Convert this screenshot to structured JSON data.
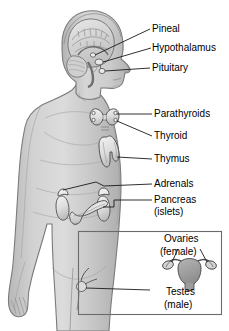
{
  "figure": {
    "background_color": "#ffffff",
    "body_fill": "#c9c9c9",
    "body_outline": "#6e6e6e",
    "organ_fill": "#e4e4e4",
    "organ_outline": "#555555",
    "leader_color": "#1a1a1a",
    "inset_border": "#6b6b6b",
    "label_color": "#000000"
  },
  "labels": {
    "pineal": "Pineal",
    "hypothalamus": "Hypothalamus",
    "pituitary": "Pituitary",
    "parathyroids": "Parathyroids",
    "thyroid": "Thyroid",
    "thymus": "Thymus",
    "adrenals": "Adrenals",
    "pancreas": "Pancreas",
    "pancreas_sub": "(islets)",
    "ovaries": "Ovaries",
    "ovaries_sub": "(female)",
    "testes": "Testes",
    "testes_sub": "(male)"
  },
  "glands": [
    {
      "name": "pineal",
      "label": "Pineal",
      "region": "brain"
    },
    {
      "name": "hypothalamus",
      "label": "Hypothalamus",
      "region": "brain"
    },
    {
      "name": "pituitary",
      "label": "Pituitary",
      "region": "brain"
    },
    {
      "name": "parathyroids",
      "label": "Parathyroids",
      "region": "neck"
    },
    {
      "name": "thyroid",
      "label": "Thyroid",
      "region": "neck"
    },
    {
      "name": "thymus",
      "label": "Thymus",
      "region": "chest"
    },
    {
      "name": "adrenals",
      "label": "Adrenals",
      "region": "abdomen"
    },
    {
      "name": "pancreas",
      "label": "Pancreas (islets)",
      "region": "abdomen"
    },
    {
      "name": "ovaries",
      "label": "Ovaries (female)",
      "region": "pelvis"
    },
    {
      "name": "testes",
      "label": "Testes (male)",
      "region": "pelvis"
    }
  ]
}
